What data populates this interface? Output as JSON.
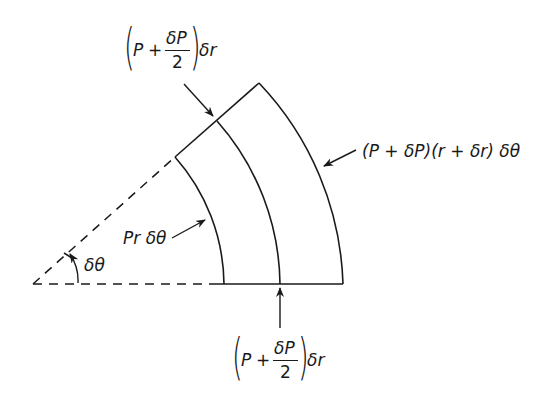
{
  "figure": {
    "type": "annular sector free-body diagram",
    "stroke_color": "#1a1a1a",
    "background": "#ffffff"
  },
  "labels": {
    "top_edge_force": {
      "open_paren": "(",
      "P": "P",
      "plus": "+",
      "numerator": "δP",
      "denominator": "2",
      "close_paren": ")",
      "tail": "δr"
    },
    "bottom_edge_force": {
      "open_paren": "(",
      "P": "P",
      "plus": "+",
      "numerator": "δP",
      "denominator": "2",
      "close_paren": ")",
      "tail": "δr"
    },
    "outer_arc_force": "(P + δP)(r + δr) δθ",
    "inner_arc_force": "Pr δθ",
    "angle": "δθ"
  }
}
